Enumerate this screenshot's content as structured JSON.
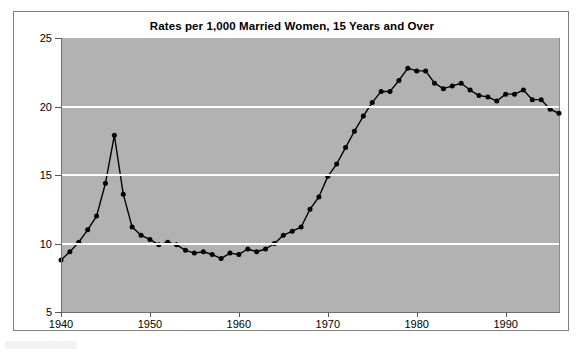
{
  "chart_data": {
    "type": "line",
    "title": "Rates per 1,000 Married Women, 15 Years and Over",
    "xlabel": "",
    "ylabel": "",
    "xlim": [
      1940,
      1996
    ],
    "ylim": [
      5,
      25
    ],
    "xticks": [
      1940,
      1950,
      1960,
      1970,
      1980,
      1990
    ],
    "yticks": [
      5,
      10,
      15,
      20,
      25
    ],
    "gridlines": {
      "horizontal": [
        10,
        15,
        20
      ],
      "vertical": false,
      "color": "#ffffff"
    },
    "legend": null,
    "markers": "filled-circle",
    "line_color": "#000000",
    "plot_background": "#b2b2b2",
    "x": [
      1940,
      1941,
      1942,
      1943,
      1944,
      1945,
      1946,
      1947,
      1948,
      1949,
      1950,
      1951,
      1952,
      1953,
      1954,
      1955,
      1956,
      1957,
      1958,
      1959,
      1960,
      1961,
      1962,
      1963,
      1964,
      1965,
      1966,
      1967,
      1968,
      1969,
      1970,
      1971,
      1972,
      1973,
      1974,
      1975,
      1976,
      1977,
      1978,
      1979,
      1980,
      1981,
      1982,
      1983,
      1984,
      1985,
      1986,
      1987,
      1988,
      1989,
      1990,
      1991,
      1992,
      1993,
      1994,
      1995,
      1996
    ],
    "values": [
      8.8,
      9.4,
      10.1,
      11.0,
      12.0,
      14.4,
      17.9,
      13.6,
      11.2,
      10.6,
      10.3,
      9.9,
      10.1,
      9.9,
      9.5,
      9.3,
      9.4,
      9.2,
      8.9,
      9.3,
      9.2,
      9.6,
      9.4,
      9.6,
      10.0,
      10.6,
      10.9,
      11.2,
      12.5,
      13.4,
      14.9,
      15.8,
      17.0,
      18.2,
      19.3,
      20.3,
      21.1,
      21.1,
      21.9,
      22.8,
      22.6,
      22.6,
      21.7,
      21.3,
      21.5,
      21.7,
      21.2,
      20.8,
      20.7,
      20.4,
      20.9,
      20.9,
      21.2,
      20.5,
      20.5,
      19.8,
      19.5
    ]
  },
  "axis": {
    "y_labels": [
      "25",
      "20",
      "15",
      "10",
      "5"
    ],
    "x_labels": [
      "1940",
      "1950",
      "1960",
      "1970",
      "1980",
      "1990"
    ]
  }
}
